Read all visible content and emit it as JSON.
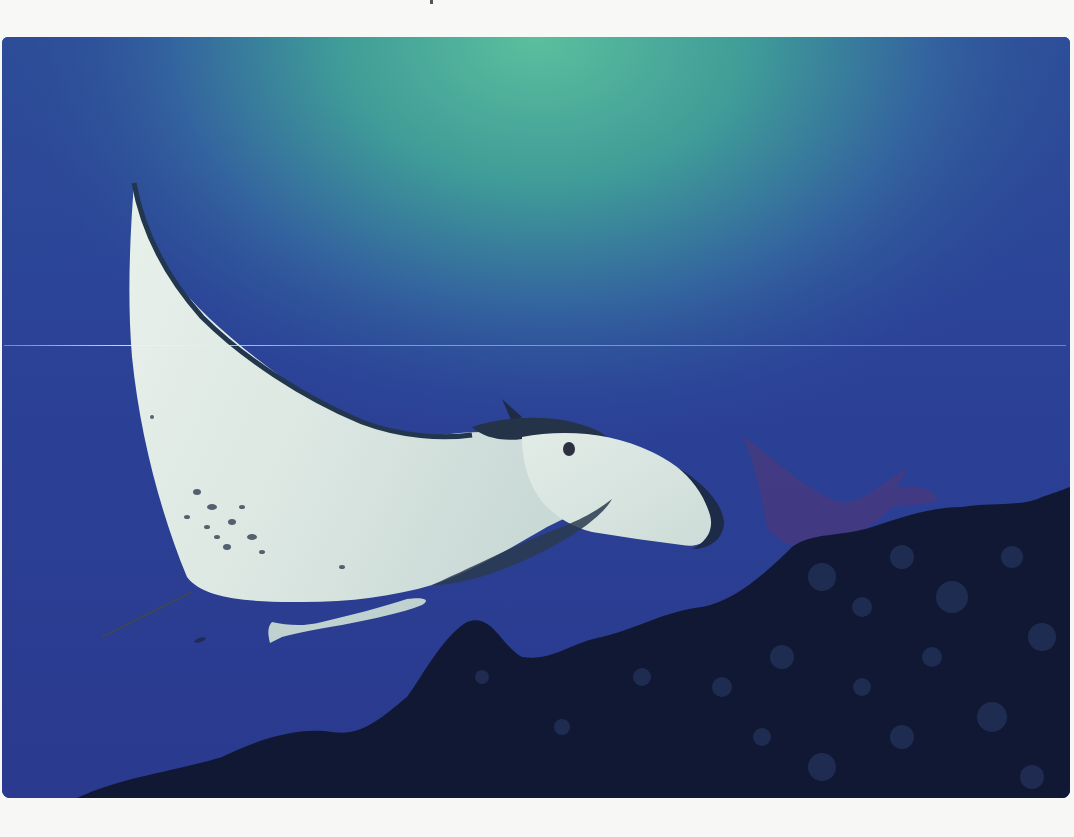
{
  "image": {
    "subject": "Manta ray swimming over coral reef",
    "description": "Underwater photograph of a large manta ray with white underside, a remora attached beneath, a second manta in the background, and dark coral reef in the lower right, lit by green-teal light from the surface.",
    "elements": [
      {
        "name": "manta-ray",
        "label": "Manta ray (foreground)"
      },
      {
        "name": "remora",
        "label": "Remora fish"
      },
      {
        "name": "background-manta",
        "label": "Manta ray (background)"
      },
      {
        "name": "coral-reef",
        "label": "Coral reef"
      },
      {
        "name": "surface-light",
        "label": "Surface light glow"
      }
    ]
  },
  "colors": {
    "deep_water": "#2a3d92",
    "mid_water": "#2f4c9c",
    "surface_glow": "#4fb39a",
    "manta_belly": "#dfe9e4",
    "manta_edge": "#263b52",
    "reef": "#0e1630",
    "page": "#f7f8f6"
  }
}
